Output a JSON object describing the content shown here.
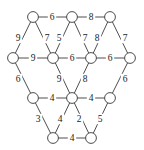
{
  "figure": {
    "type": "weighted-graph-diagram",
    "background_color": "#ffffff",
    "node_fill_color": "#ffffff",
    "stroke_color": "#3a3a3a",
    "label_color": "#1a1a1a",
    "node_radius": 5.4
  },
  "nodes": [
    {
      "id": "n0",
      "row": 0,
      "col": 0,
      "x": 33,
      "y": 17,
      "label": ""
    },
    {
      "id": "n1",
      "row": 0,
      "col": 1,
      "x": 72,
      "y": 17,
      "label": ""
    },
    {
      "id": "n2",
      "row": 0,
      "col": 2,
      "x": 110,
      "y": 17,
      "label": ""
    },
    {
      "id": "n3",
      "row": 1,
      "col": 0,
      "x": 13,
      "y": 58,
      "label": ""
    },
    {
      "id": "n4",
      "row": 1,
      "col": 1,
      "x": 53,
      "y": 58,
      "label": ""
    },
    {
      "id": "n5",
      "row": 1,
      "col": 2,
      "x": 91,
      "y": 58,
      "label": ""
    },
    {
      "id": "n6",
      "row": 1,
      "col": 3,
      "x": 130,
      "y": 58,
      "label": ""
    },
    {
      "id": "n7",
      "row": 2,
      "col": 0,
      "x": 33,
      "y": 98,
      "label": ""
    },
    {
      "id": "n8",
      "row": 2,
      "col": 1,
      "x": 72,
      "y": 98,
      "label": ""
    },
    {
      "id": "n9",
      "row": 2,
      "col": 2,
      "x": 110,
      "y": 98,
      "label": ""
    },
    {
      "id": "n10",
      "row": 3,
      "col": 0,
      "x": 53,
      "y": 138,
      "label": ""
    },
    {
      "id": "n11",
      "row": 3,
      "col": 1,
      "x": 91,
      "y": 138,
      "label": ""
    }
  ],
  "edges": [
    {
      "id": "e0",
      "from": "n0",
      "to": "n1",
      "weight": "6",
      "lx": 52,
      "ly": 17
    },
    {
      "id": "e1",
      "from": "n1",
      "to": "n2",
      "weight": "8",
      "lx": 91,
      "ly": 17
    },
    {
      "id": "e2",
      "from": "n0",
      "to": "n3",
      "weight": "9",
      "lx": 18,
      "ly": 38
    },
    {
      "id": "e3",
      "from": "n0",
      "to": "n4",
      "weight": "7",
      "lx": 47,
      "ly": 38
    },
    {
      "id": "e4",
      "from": "n1",
      "to": "n4",
      "weight": "5",
      "lx": 59,
      "ly": 38
    },
    {
      "id": "e5",
      "from": "n1",
      "to": "n5",
      "weight": "7",
      "lx": 85,
      "ly": 38
    },
    {
      "id": "e6",
      "from": "n2",
      "to": "n5",
      "weight": "8",
      "lx": 97,
      "ly": 38
    },
    {
      "id": "e7",
      "from": "n2",
      "to": "n6",
      "weight": "7",
      "lx": 125,
      "ly": 38
    },
    {
      "id": "e8",
      "from": "n3",
      "to": "n4",
      "weight": "9",
      "lx": 33,
      "ly": 58
    },
    {
      "id": "e9",
      "from": "n4",
      "to": "n5",
      "weight": "6",
      "lx": 72,
      "ly": 58
    },
    {
      "id": "e10",
      "from": "n5",
      "to": "n6",
      "weight": "6",
      "lx": 110,
      "ly": 58
    },
    {
      "id": "e11",
      "from": "n3",
      "to": "n7",
      "weight": "6",
      "lx": 18,
      "ly": 79
    },
    {
      "id": "e12",
      "from": "n4",
      "to": "n8",
      "weight": "9",
      "lx": 59,
      "ly": 79
    },
    {
      "id": "e13",
      "from": "n5",
      "to": "n8",
      "weight": "8",
      "lx": 85,
      "ly": 79
    },
    {
      "id": "e14",
      "from": "n6",
      "to": "n9",
      "weight": "6",
      "lx": 125,
      "ly": 79
    },
    {
      "id": "e15",
      "from": "n7",
      "to": "n8",
      "weight": "4",
      "lx": 52,
      "ly": 98
    },
    {
      "id": "e16",
      "from": "n8",
      "to": "n9",
      "weight": "4",
      "lx": 91,
      "ly": 98
    },
    {
      "id": "e17",
      "from": "n7",
      "to": "n10",
      "weight": "3",
      "lx": 38,
      "ly": 119
    },
    {
      "id": "e18",
      "from": "n8",
      "to": "n10",
      "weight": "4",
      "lx": 60,
      "ly": 119
    },
    {
      "id": "e19",
      "from": "n8",
      "to": "n11",
      "weight": "2",
      "lx": 79,
      "ly": 119
    },
    {
      "id": "e20",
      "from": "n9",
      "to": "n11",
      "weight": "5",
      "lx": 100,
      "ly": 119
    },
    {
      "id": "e21",
      "from": "n10",
      "to": "n11",
      "weight": "4",
      "lx": 72,
      "ly": 138
    }
  ],
  "chart_data": {
    "type": "graph",
    "title": "",
    "node_count": 12,
    "edge_count": 22,
    "weights": [
      "6",
      "8",
      "9",
      "7",
      "5",
      "7",
      "8",
      "7",
      "9",
      "6",
      "6",
      "6",
      "9",
      "8",
      "6",
      "4",
      "4",
      "3",
      "4",
      "2",
      "5",
      "4"
    ]
  }
}
